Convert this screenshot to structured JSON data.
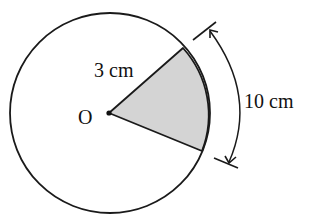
{
  "diagram": {
    "type": "circle-sector",
    "center_label": "O",
    "radius_label": "3 cm",
    "arc_label": "10 cm",
    "colors": {
      "stroke": "#1a1a1a",
      "sector_fill": "#d4d4d4",
      "background": "#ffffff"
    }
  }
}
